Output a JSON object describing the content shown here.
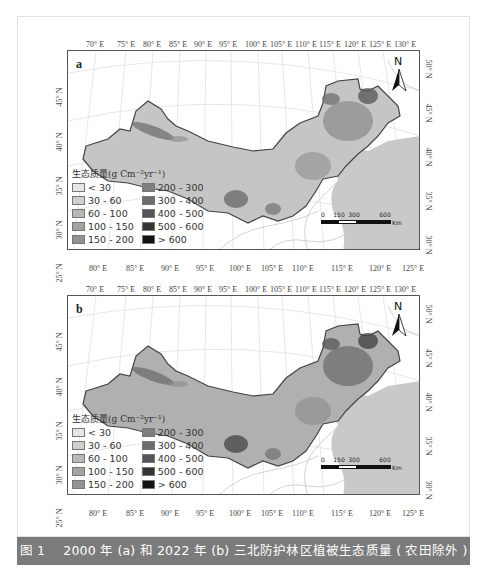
{
  "figure": {
    "caption_number": "图 1",
    "caption_text": "2000 年 (a) 和 2022 年 (b) 三北防护林区植被生态质量 ( 农田除外 ) 分布"
  },
  "panels": [
    {
      "label": "a",
      "year": "2000",
      "top_lon_labels": [
        "70° E",
        "75° E",
        "80° E",
        "85° E",
        "90° E",
        "95° E",
        "100° E",
        "105° E",
        "110° E",
        "115° E",
        "120° E",
        "125° E",
        "130° E"
      ],
      "bottom_lon_labels": [
        "80° E",
        "85° E",
        "90° E",
        "95° E",
        "100° E",
        "105° E",
        "110° E",
        "115° E",
        "120° E",
        "125° E"
      ],
      "left_lat_labels": [
        "45° N",
        "40° N",
        "35° N",
        "30° N",
        "25° N"
      ],
      "right_lat_labels": [
        "50° N",
        "45° N",
        "40° N",
        "35° N",
        "30° N"
      ]
    },
    {
      "label": "b",
      "year": "2022",
      "top_lon_labels": [
        "70° E",
        "75° E",
        "80° E",
        "85° E",
        "90° E",
        "95° E",
        "100° E",
        "105° E",
        "110° E",
        "115° E",
        "120° E",
        "125° E",
        "130° E"
      ],
      "bottom_lon_labels": [
        "80° E",
        "85° E",
        "90° E",
        "95° E",
        "100° E",
        "105° E",
        "110° E",
        "115° E",
        "120° E",
        "125° E"
      ],
      "left_lat_labels": [
        "45° N",
        "40° N",
        "35° N",
        "30° N",
        "25° N"
      ],
      "right_lat_labels": [
        "50° N",
        "45° N",
        "40° N",
        "35° N",
        "30° N"
      ]
    }
  ],
  "legend": {
    "title": "生态质量(g Cm⁻²yr⁻¹)",
    "items": [
      {
        "label": "< 30",
        "color": "#e6e6e6"
      },
      {
        "label": "30 - 60",
        "color": "#cfcfcf"
      },
      {
        "label": "60 - 100",
        "color": "#b8b8b8"
      },
      {
        "label": "100 - 150",
        "color": "#a3a3a3"
      },
      {
        "label": "150 - 200",
        "color": "#929292"
      },
      {
        "label": "200 - 300",
        "color": "#7f7f7f"
      },
      {
        "label": "300 - 400",
        "color": "#6c6c6c"
      },
      {
        "label": "400 - 500",
        "color": "#555555"
      },
      {
        "label": "500 - 600",
        "color": "#333333"
      },
      {
        "label": "> 600",
        "color": "#111111"
      }
    ]
  },
  "north_arrow": {
    "label": "N"
  },
  "scale_bar": {
    "labels": [
      "0",
      "150",
      "300",
      "600"
    ],
    "unit": "Km"
  }
}
